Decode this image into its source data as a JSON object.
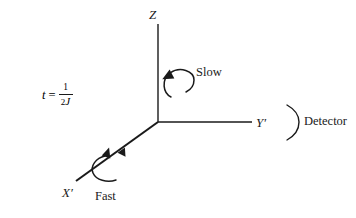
{
  "figure": {
    "background_color": "#ffffff",
    "line_color": "#1a1a1a",
    "equation": {
      "variable": "t",
      "equals": "=",
      "numerator": "1",
      "denominator_coefficient": "2",
      "denominator_symbol": "J"
    },
    "axes": [
      {
        "id": "z-axis",
        "label": "Z",
        "orientation": "vertical-up"
      },
      {
        "id": "y-axis",
        "label": "Y",
        "prime": "′",
        "orientation": "horizontal-right"
      },
      {
        "id": "x-axis",
        "label": "X",
        "prime": "′",
        "orientation": "diagonal-lower-left"
      }
    ],
    "rotations": [
      {
        "id": "slow-rotation",
        "label": "Slow",
        "about": "Z"
      },
      {
        "id": "fast-rotation",
        "label": "Fast",
        "about": "X′"
      }
    ],
    "detector": {
      "label": "Detector",
      "marker": "arc"
    }
  }
}
